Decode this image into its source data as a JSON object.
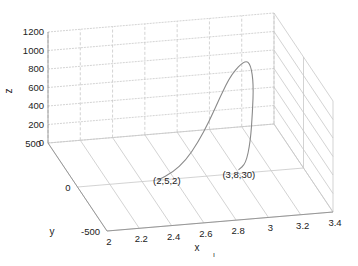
{
  "chart_data": {
    "type": "line",
    "subtype": "3d-curve",
    "title": "",
    "xlabel": "x",
    "ylabel": "y",
    "zlabel": "z",
    "xlim": [
      2,
      3.4
    ],
    "ylim": [
      -500,
      500
    ],
    "zlim": [
      0,
      1200
    ],
    "xticks": [
      "2",
      "2.2",
      "2.4",
      "2.6",
      "2.8",
      "3",
      "3.2",
      "3.4"
    ],
    "yticks": [
      "-500",
      "0",
      "500"
    ],
    "zticks": [
      "0",
      "200",
      "400",
      "600",
      "800",
      "1000",
      "1200"
    ],
    "grid": true,
    "series": [
      {
        "name": "curve",
        "points": [
          {
            "x": 2.5,
            "y": 2,
            "z": 0
          },
          {
            "x": 2.6,
            "y": 30,
            "z": 40
          },
          {
            "x": 2.7,
            "y": 80,
            "z": 110
          },
          {
            "x": 2.8,
            "y": 150,
            "z": 220
          },
          {
            "x": 2.9,
            "y": 230,
            "z": 360
          },
          {
            "x": 3.0,
            "y": 320,
            "z": 520
          },
          {
            "x": 3.1,
            "y": 400,
            "z": 680
          },
          {
            "x": 3.2,
            "y": 440,
            "z": 780
          },
          {
            "x": 3.22,
            "y": 400,
            "z": 760
          },
          {
            "x": 3.2,
            "y": 300,
            "z": 650
          },
          {
            "x": 3.15,
            "y": 180,
            "z": 470
          },
          {
            "x": 3.1,
            "y": 80,
            "z": 250
          },
          {
            "x": 3.05,
            "y": 20,
            "z": 80
          },
          {
            "x": 3,
            "y": 8,
            "z": 30
          }
        ]
      }
    ],
    "annotations": [
      {
        "text": "(2,5,2)",
        "x": 2.5,
        "y": 2,
        "z": 0
      },
      {
        "text": "(3,8,30)",
        "x": 3,
        "y": 8,
        "z": 30
      }
    ],
    "extra_text": "ı"
  }
}
